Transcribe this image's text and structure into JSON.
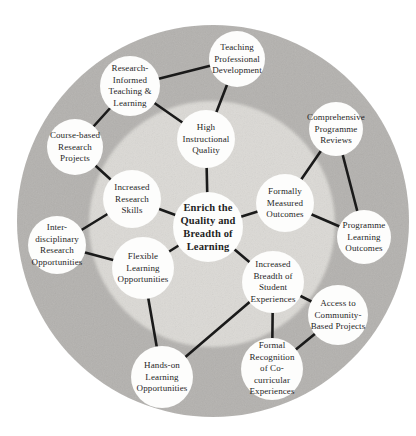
{
  "figure": {
    "type": "circular-concept-map",
    "center_theme": "Enrich the Quality and Breadth of Learning"
  },
  "colors": {
    "background": "#ffffff",
    "outer_ring": "#b4b2af",
    "inner_circle": "#dcdad6",
    "node_fill": "#fdfdfc",
    "edge": "#1a1a1a",
    "text": "#1f1f1f"
  },
  "canvas": {
    "width": 416,
    "height": 436
  },
  "rings": [
    {
      "id": "outer",
      "cx": 213,
      "cy": 221,
      "r": 196,
      "color_key": "outer_ring",
      "soft": false
    },
    {
      "id": "inner",
      "cx": 212,
      "cy": 224,
      "r": 123,
      "color_key": "inner_circle",
      "soft": true
    }
  ],
  "nodes": [
    {
      "id": "center",
      "lines": [
        "Enrich the",
        "Quality and",
        "Breadth of",
        "Learning"
      ],
      "x": 208,
      "y": 227,
      "r": 35,
      "bold": true
    },
    {
      "id": "high-instructional-quality",
      "lines": [
        "High",
        "Instructional",
        "Quality"
      ],
      "x": 206,
      "y": 139,
      "r": 29
    },
    {
      "id": "formally-measured-outcomes",
      "lines": [
        "Formally",
        "Measured",
        "Outcomes"
      ],
      "x": 285,
      "y": 203,
      "r": 29
    },
    {
      "id": "increased-breadth-student-experiences",
      "lines": [
        "Increased",
        "Breadth of",
        "Student",
        "Experiences"
      ],
      "x": 273,
      "y": 282,
      "r": 31
    },
    {
      "id": "flexible-learning-opportunities",
      "lines": [
        "Flexible",
        "Learning",
        "Opportunities"
      ],
      "x": 143,
      "y": 268,
      "r": 31
    },
    {
      "id": "increased-research-skills",
      "lines": [
        "Increased",
        "Research",
        "Skills"
      ],
      "x": 132,
      "y": 199,
      "r": 29
    },
    {
      "id": "teaching-professional-development",
      "lines": [
        "Teaching",
        "Professional",
        "Development"
      ],
      "x": 237,
      "y": 59,
      "r": 28
    },
    {
      "id": "research-informed-teaching-learning",
      "lines": [
        "Research-",
        "Informed",
        "Teaching &",
        "Learning"
      ],
      "x": 130,
      "y": 86,
      "r": 30
    },
    {
      "id": "course-based-research-projects",
      "lines": [
        "Course-based",
        "Research",
        "Projects"
      ],
      "x": 75,
      "y": 147,
      "r": 28
    },
    {
      "id": "interdisciplinary-research-opportunities",
      "lines": [
        "Inter-",
        "disciplinary",
        "Research",
        "Opportunities"
      ],
      "x": 57,
      "y": 245,
      "r": 29
    },
    {
      "id": "comprehensive-programme-reviews",
      "lines": [
        "Comprehensive",
        "Programme",
        "Reviews"
      ],
      "x": 336,
      "y": 129,
      "r": 27
    },
    {
      "id": "programme-learning-outcomes",
      "lines": [
        "Programme",
        "Learning",
        "Outcomes"
      ],
      "x": 364,
      "y": 237,
      "r": 27
    },
    {
      "id": "access-community-based-projects",
      "lines": [
        "Access to",
        "Community-",
        "Based Projects"
      ],
      "x": 338,
      "y": 315,
      "r": 30
    },
    {
      "id": "formal-recognition-cocurricular-experiences",
      "lines": [
        "Formal",
        "Recognition",
        "of Co-",
        "curricular",
        "Experiences"
      ],
      "x": 272,
      "y": 369,
      "r": 31
    },
    {
      "id": "hands-on-learning-opportunities",
      "lines": [
        "Hands-on",
        "Learning",
        "Opportunities"
      ],
      "x": 162,
      "y": 377,
      "r": 31
    }
  ],
  "edges": [
    [
      "center",
      "high-instructional-quality"
    ],
    [
      "center",
      "formally-measured-outcomes"
    ],
    [
      "center",
      "increased-breadth-student-experiences"
    ],
    [
      "center",
      "flexible-learning-opportunities"
    ],
    [
      "center",
      "increased-research-skills"
    ],
    [
      "high-instructional-quality",
      "teaching-professional-development"
    ],
    [
      "high-instructional-quality",
      "research-informed-teaching-learning"
    ],
    [
      "research-informed-teaching-learning",
      "teaching-professional-development"
    ],
    [
      "research-informed-teaching-learning",
      "course-based-research-projects"
    ],
    [
      "course-based-research-projects",
      "increased-research-skills"
    ],
    [
      "increased-research-skills",
      "interdisciplinary-research-opportunities"
    ],
    [
      "interdisciplinary-research-opportunities",
      "flexible-learning-opportunities"
    ],
    [
      "flexible-learning-opportunities",
      "hands-on-learning-opportunities"
    ],
    [
      "hands-on-learning-opportunities",
      "increased-breadth-student-experiences"
    ],
    [
      "increased-breadth-student-experiences",
      "access-community-based-projects"
    ],
    [
      "increased-breadth-student-experiences",
      "formal-recognition-cocurricular-experiences"
    ],
    [
      "access-community-based-projects",
      "formal-recognition-cocurricular-experiences"
    ],
    [
      "formally-measured-outcomes",
      "comprehensive-programme-reviews"
    ],
    [
      "formally-measured-outcomes",
      "programme-learning-outcomes"
    ],
    [
      "comprehensive-programme-reviews",
      "programme-learning-outcomes"
    ]
  ],
  "style": {
    "edge_width": 2.6,
    "label_font_px": 9,
    "center_font_px": 10.5
  }
}
